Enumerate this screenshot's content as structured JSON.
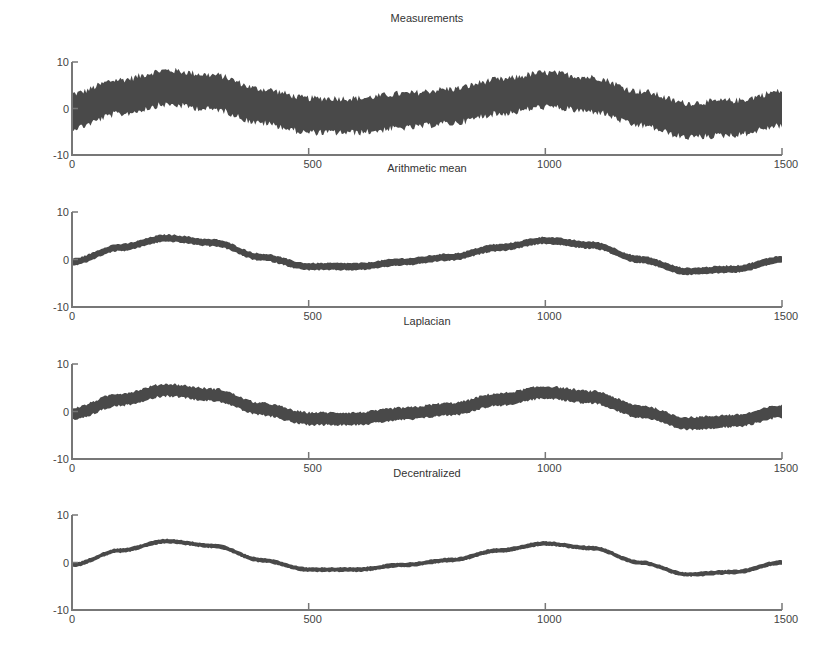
{
  "figure": {
    "panels": [
      {
        "title": "Measurements"
      },
      {
        "title": "Arithmetic mean"
      },
      {
        "title": "Laplacian"
      },
      {
        "title": "Decentralized"
      }
    ],
    "x_ticks": [
      "0",
      "500",
      "1000",
      "1500"
    ],
    "y_ticks": [
      "10",
      "0",
      "-10"
    ]
  },
  "chart_data": [
    {
      "type": "line",
      "title": "Measurements",
      "xlabel": "",
      "ylabel": "",
      "xlim": [
        0,
        1500
      ],
      "ylim": [
        -10,
        10
      ],
      "x_ticks": [
        0,
        500,
        1000,
        1500
      ],
      "y_ticks": [
        -10,
        0,
        10
      ],
      "grid": false,
      "noise_band_halfwidth": 4,
      "x": [
        0,
        100,
        200,
        300,
        400,
        500,
        600,
        700,
        800,
        900,
        1000,
        1100,
        1200,
        1300,
        1400,
        1500
      ],
      "series": [
        {
          "name": "signal",
          "values": [
            -0.5,
            2.5,
            4.5,
            3.5,
            0.5,
            -1.5,
            -1.5,
            -0.5,
            0.5,
            2.5,
            4.0,
            3.0,
            0.0,
            -2.5,
            -2.0,
            0.0
          ]
        }
      ]
    },
    {
      "type": "line",
      "title": "Arithmetic mean",
      "xlabel": "",
      "ylabel": "",
      "xlim": [
        0,
        1500
      ],
      "ylim": [
        -10,
        10
      ],
      "x_ticks": [
        0,
        500,
        1000,
        1500
      ],
      "y_ticks": [
        -10,
        0,
        10
      ],
      "grid": false,
      "noise_band_halfwidth": 0.8,
      "x": [
        0,
        100,
        200,
        300,
        400,
        500,
        600,
        700,
        800,
        900,
        1000,
        1100,
        1200,
        1300,
        1400,
        1500
      ],
      "series": [
        {
          "name": "estimate",
          "values": [
            -0.5,
            2.5,
            4.5,
            3.5,
            0.5,
            -1.5,
            -1.5,
            -0.5,
            0.5,
            2.5,
            4.0,
            3.0,
            0.0,
            -2.5,
            -2.0,
            0.0
          ]
        }
      ]
    },
    {
      "type": "line",
      "title": "Laplacian",
      "xlabel": "",
      "ylabel": "",
      "xlim": [
        0,
        1500
      ],
      "ylim": [
        -10,
        10
      ],
      "x_ticks": [
        0,
        500,
        1000,
        1500
      ],
      "y_ticks": [
        -10,
        0,
        10
      ],
      "grid": false,
      "noise_band_halfwidth": 1.4,
      "x": [
        0,
        100,
        200,
        300,
        400,
        500,
        600,
        700,
        800,
        900,
        1000,
        1100,
        1200,
        1300,
        1400,
        1500
      ],
      "series": [
        {
          "name": "estimate",
          "values": [
            -0.5,
            2.5,
            4.5,
            3.5,
            0.5,
            -1.5,
            -1.5,
            -0.5,
            0.5,
            2.5,
            4.0,
            3.0,
            0.0,
            -2.5,
            -2.0,
            0.0
          ]
        }
      ]
    },
    {
      "type": "line",
      "title": "Decentralized",
      "xlabel": "",
      "ylabel": "",
      "xlim": [
        0,
        1500
      ],
      "ylim": [
        -10,
        10
      ],
      "x_ticks": [
        0,
        500,
        1000,
        1500
      ],
      "y_ticks": [
        -10,
        0,
        10
      ],
      "grid": false,
      "noise_band_halfwidth": 0.5,
      "x": [
        0,
        100,
        200,
        300,
        400,
        500,
        600,
        700,
        800,
        900,
        1000,
        1100,
        1200,
        1300,
        1400,
        1500
      ],
      "series": [
        {
          "name": "estimate",
          "values": [
            -0.5,
            2.5,
            4.5,
            3.5,
            0.5,
            -1.5,
            -1.5,
            -0.5,
            0.5,
            2.5,
            4.0,
            3.0,
            0.0,
            -2.5,
            -2.0,
            0.0
          ]
        }
      ]
    }
  ]
}
